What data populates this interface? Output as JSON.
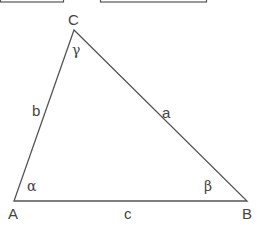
{
  "diagram": {
    "title": "",
    "colors": {
      "stroke": "#555555",
      "text": "#444444",
      "background": "#ffffff"
    },
    "top_boxes": [
      {
        "x": 0,
        "y": -30,
        "w": 63,
        "h": 32
      },
      {
        "x": 100,
        "y": -30,
        "w": 106,
        "h": 32
      }
    ],
    "vertices": {
      "A": {
        "label": "A",
        "x": 14,
        "y": 201
      },
      "B": {
        "label": "B",
        "x": 247,
        "y": 201
      },
      "C": {
        "label": "C",
        "x": 74,
        "y": 30
      }
    },
    "sides": {
      "a": {
        "label": "a"
      },
      "b": {
        "label": "b"
      },
      "c": {
        "label": "c"
      }
    },
    "angles": {
      "alpha": {
        "label": "α"
      },
      "beta": {
        "label": "β"
      },
      "gamma": {
        "label": "γ"
      }
    }
  }
}
